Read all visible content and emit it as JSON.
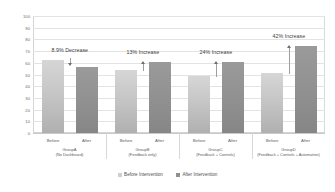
{
  "chart_data": {
    "type": "bar",
    "title": "",
    "xlabel": "",
    "ylabel": "Organisation's Energy Efficient Product Support",
    "ylim": [
      0,
      100
    ],
    "yticks": [
      0,
      10,
      20,
      30,
      40,
      50,
      60,
      70,
      80,
      90,
      100
    ],
    "grid": true,
    "legend_position": "bottom",
    "categories": [
      "GroupA",
      "GroupB",
      "GroupC",
      "GroupD"
    ],
    "category_sublabels": [
      "(No Dashboard)",
      "(Feedback only)",
      "(Feedback + Controls)",
      "(Feedback + Controls + Automation)"
    ],
    "bar_labels": [
      "Before",
      "After"
    ],
    "series": [
      {
        "name": "Before Intervention",
        "values": [
          62,
          53.5,
          49,
          51
        ],
        "color": "#c6c6c6"
      },
      {
        "name": "After Intervention",
        "values": [
          56.5,
          60.5,
          61,
          74
        ],
        "color": "#919191"
      }
    ],
    "annotations": [
      {
        "text": "8.9% Decrease",
        "direction": "down"
      },
      {
        "text": "13% Increase",
        "direction": "up"
      },
      {
        "text": "24% Increase",
        "direction": "up"
      },
      {
        "text": "42% Increase",
        "direction": "up"
      }
    ]
  },
  "legend": {
    "items": [
      {
        "label": "Before Intervention"
      },
      {
        "label": "After Intervention"
      }
    ]
  }
}
